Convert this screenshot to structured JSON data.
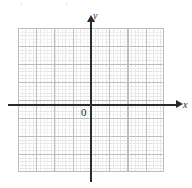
{
  "figure": {
    "kind": "blank-cartesian-grid",
    "title": "",
    "background_color": "#ffffff"
  },
  "axes": {
    "x": {
      "label": "x",
      "color": "#2b2b2b",
      "arrowhead": "right",
      "name": "x-axis"
    },
    "y": {
      "label": "y",
      "color": "#2b2b2b",
      "arrowhead": "up",
      "name": "y-axis"
    },
    "origin": {
      "label": "0",
      "color": "#2b2b2b"
    }
  },
  "grid": {
    "major_color": "#bdbdbd",
    "minor_color": "#e2e2e2",
    "major_columns": 8,
    "major_rows": 8,
    "minor_per_major": 5,
    "visible": true,
    "style": "major solid, minor dotted"
  },
  "chart_data": {
    "type": "scatter",
    "title": "",
    "xlabel": "x",
    "ylabel": "y",
    "x": [],
    "y": [],
    "series": [],
    "xlim": [
      -4,
      4
    ],
    "ylim": [
      -4,
      4
    ],
    "xticks": [],
    "yticks": [],
    "grid": true,
    "legend": "none",
    "annotations": [
      "0"
    ]
  }
}
